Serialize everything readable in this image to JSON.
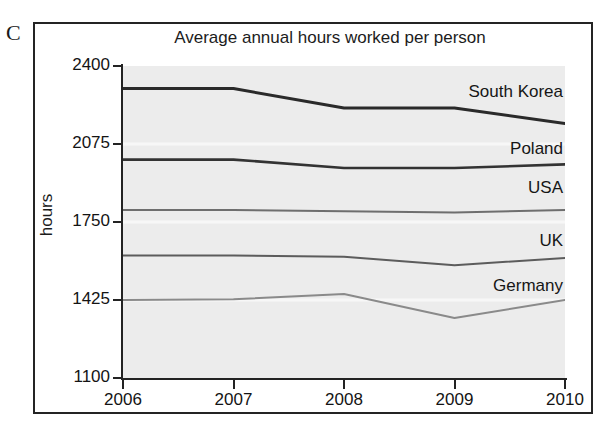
{
  "figure": {
    "panel_letter": "C"
  },
  "chart_data": {
    "type": "line",
    "title": "Average annual hours worked per person",
    "xlabel": "",
    "ylabel": "hours",
    "x": [
      2006,
      2007,
      2008,
      2009,
      2010
    ],
    "xticklabels": [
      "2006",
      "2007",
      "2008",
      "2009",
      "2010"
    ],
    "yticks": [
      1100,
      1425,
      1750,
      2075,
      2400
    ],
    "yticklabels": [
      "1100",
      "1425",
      "1750",
      "2075",
      "2400"
    ],
    "ylim": [
      1100,
      2400
    ],
    "xlim": [
      2006,
      2010
    ],
    "grid": false,
    "legend_position": "inline-right-labels",
    "plot_background": "#ececec",
    "series": [
      {
        "name": "South Korea",
        "values": [
          2306,
          2306,
          2225,
          2225,
          2160
        ],
        "color": "#2a2a2a",
        "width": 3.0,
        "label_x": 300,
        "label_y": 16
      },
      {
        "name": "Poland",
        "values": [
          2010,
          2010,
          1975,
          1975,
          1990
        ],
        "color": "#333333",
        "width": 2.6,
        "label_x": 300,
        "label_y": 73
      },
      {
        "name": "USA",
        "values": [
          1800,
          1800,
          1795,
          1790,
          1800
        ],
        "color": "#6e6e6e",
        "width": 2.0,
        "label_x": 330,
        "label_y": 112
      },
      {
        "name": "UK",
        "values": [
          1610,
          1610,
          1605,
          1570,
          1600
        ],
        "color": "#5c5c5c",
        "width": 2.0,
        "label_x": 350,
        "label_y": 165
      },
      {
        "name": "Germany",
        "values": [
          1425,
          1428,
          1450,
          1350,
          1425
        ],
        "color": "#8a8a8a",
        "width": 2.0,
        "label_x": 288,
        "label_y": 210
      }
    ]
  }
}
